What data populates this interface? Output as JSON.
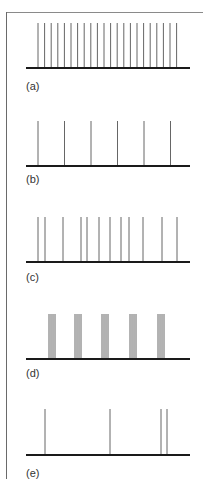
{
  "figure": {
    "panels": [
      {
        "label": "(a)",
        "pattern": "regular high-frequency firing",
        "spike_top": 23,
        "baseline_y": 68,
        "label_y": 80,
        "spikes_x": [
          38,
          44.6,
          51.2,
          57.8,
          64.4,
          71,
          77.6,
          84.2,
          90.8,
          97.4,
          104,
          110.6,
          117.2,
          123.8,
          130.4,
          137,
          143.6,
          150.2,
          156.8,
          163.4,
          170,
          176.6
        ]
      },
      {
        "label": "(b)",
        "pattern": "regular low-frequency firing",
        "spike_top": 121,
        "baseline_y": 166,
        "label_y": 173,
        "spikes_x": [
          38,
          64.5,
          91,
          117.5,
          144,
          170.5
        ]
      },
      {
        "label": "(c)",
        "pattern": "irregular firing",
        "spike_top": 217,
        "baseline_y": 262,
        "label_y": 271,
        "spikes_x": [
          38,
          45,
          63,
          81,
          87,
          99,
          110,
          121,
          129,
          143,
          162,
          177
        ]
      },
      {
        "label": "(d)",
        "pattern": "burst firing (4 spikes per burst)",
        "spike_top": 314,
        "baseline_y": 359,
        "label_y": 367,
        "spikes_x": [
          49,
          51,
          53,
          55,
          75,
          77,
          79,
          81,
          102,
          104,
          106,
          108,
          130,
          132,
          134,
          136,
          158,
          160,
          162,
          164
        ]
      },
      {
        "label": "(e)",
        "pattern": "sparse irregular firing",
        "spike_top": 409,
        "baseline_y": 455,
        "label_y": 467,
        "spikes_x": [
          45,
          110,
          161,
          167
        ]
      }
    ],
    "baseline_x_start": 26,
    "baseline_x_end": 190,
    "colors": {
      "spike": "#555555",
      "baseline": "#1a1a1a",
      "label": "#333333",
      "frame": "#7a7a7a"
    }
  }
}
